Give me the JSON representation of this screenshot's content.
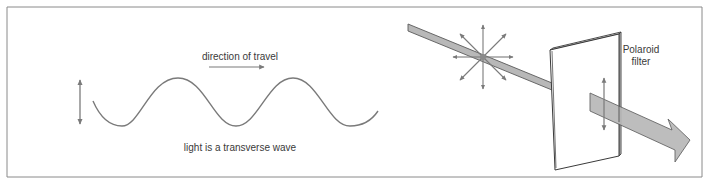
{
  "figure": {
    "wave_panel": {
      "direction_label": "direction of travel",
      "caption": "light is a transverse wave"
    },
    "polaroid_panel": {
      "filter_label_line1": "Polaroid",
      "filter_label_line2": "filter"
    }
  },
  "colors": {
    "frame": "#8a8a8a",
    "line": "#7a7a7a",
    "beam_fill": "#b8b8b8",
    "beam_edge": "#5a5a5a",
    "text": "#3a3a3a"
  }
}
